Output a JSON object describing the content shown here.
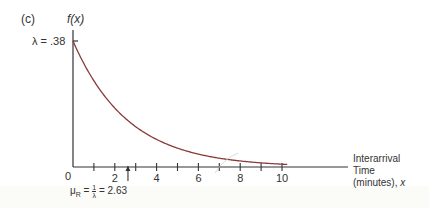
{
  "chart_data": {
    "type": "line",
    "panel_label": "(c)",
    "title": "",
    "ylabel": "f(x)",
    "xlabel": "Interarrival Time (minutes), x",
    "xlabel_lines": [
      "Interarrival",
      "Time",
      "(minutes), x"
    ],
    "function": "f(x) = 0.38 * exp(-0.38 x)",
    "lambda": 0.38,
    "y_annotation": "λ = .38",
    "mean_annotation": "μ_R = 1/λ = 2.63",
    "mean_value": 2.63,
    "origin_label": "0",
    "x_tick_labels": [
      "2",
      "4",
      "6",
      "8",
      "10"
    ],
    "x_ticks_minor": [
      1,
      3,
      5,
      7,
      9
    ],
    "xlim": [
      0,
      10.5
    ],
    "ylim": [
      0,
      0.38
    ],
    "x": [
      0,
      1,
      2,
      3,
      4,
      5,
      6,
      7,
      8,
      9,
      10
    ],
    "series": [
      {
        "name": "f(x)",
        "values": [
          0.38,
          0.26,
          0.178,
          0.122,
          0.083,
          0.057,
          0.039,
          0.027,
          0.018,
          0.012,
          0.009
        ],
        "color": "#8b3a3a"
      }
    ],
    "grid": false,
    "legend": "none"
  },
  "colors": {
    "axis": "#333333",
    "curve": "#8b3a3a"
  }
}
